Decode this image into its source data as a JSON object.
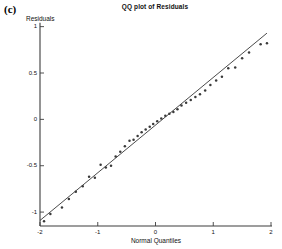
{
  "panel": {
    "label": "(c)"
  },
  "chart_data": {
    "type": "scatter",
    "title": "QQ plot of Residuals",
    "xlabel": "Normal Quantiles",
    "ylabel": "Residuals",
    "xlim": [
      -2,
      2
    ],
    "ylim": [
      -1.15,
      1.05
    ],
    "grid": false,
    "legend": null,
    "xticks": [
      -2,
      -1,
      0,
      1,
      2
    ],
    "xticklabels": [
      "-2",
      "-1",
      "0",
      "1",
      "2"
    ],
    "yticks": [
      -1,
      -0.5,
      0,
      0.5,
      1
    ],
    "yticklabels": [
      "-1",
      "-0.5",
      "0",
      "0.5",
      "1"
    ],
    "marker": "dot",
    "marker_color": "#3a3a3a",
    "line_color": "#2b2b2b",
    "axis_color": "#3c3c3c",
    "reference_line": {
      "name": "qq-reference-line",
      "x": [
        -2.0,
        1.93
      ],
      "y": [
        -1.09,
        0.93
      ]
    },
    "series": [
      {
        "name": "residual quantiles",
        "x": [
          -1.93,
          -1.82,
          -1.62,
          -1.5,
          -1.38,
          -1.26,
          -1.15,
          -1.05,
          -0.95,
          -0.86,
          -0.77,
          -0.69,
          -0.61,
          -0.53,
          -0.45,
          -0.38,
          -0.31,
          -0.24,
          -0.17,
          -0.1,
          -0.04,
          0.03,
          0.1,
          0.17,
          0.24,
          0.31,
          0.38,
          0.45,
          0.53,
          0.61,
          0.69,
          0.77,
          0.86,
          0.95,
          1.05,
          1.15,
          1.26,
          1.38,
          1.5,
          1.62,
          1.82,
          1.93
        ],
        "y": [
          -1.1,
          -1.02,
          -0.95,
          -0.86,
          -0.78,
          -0.72,
          -0.62,
          -0.63,
          -0.49,
          -0.52,
          -0.5,
          -0.4,
          -0.35,
          -0.29,
          -0.23,
          -0.22,
          -0.18,
          -0.14,
          -0.11,
          -0.08,
          -0.05,
          -0.02,
          0.01,
          0.04,
          0.06,
          0.08,
          0.11,
          0.15,
          0.18,
          0.21,
          0.24,
          0.27,
          0.31,
          0.37,
          0.42,
          0.46,
          0.55,
          0.56,
          0.66,
          0.72,
          0.81,
          0.82
        ]
      }
    ]
  }
}
